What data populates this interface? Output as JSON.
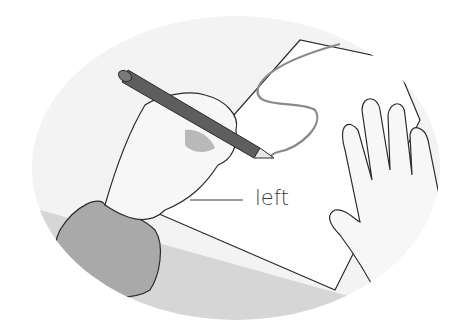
{
  "illustration": {
    "subject": "hand writing with a pencil, other hand holding paper",
    "label": "left",
    "colors": {
      "background": "#ffffff",
      "oval_fill": "#f1f1f1",
      "sleeve": "#a9a9a9",
      "pencil": "#5e5e5e",
      "line": "#2b2b2b",
      "scribble": "#8a8a8a",
      "text": "#3a3a3a"
    }
  }
}
